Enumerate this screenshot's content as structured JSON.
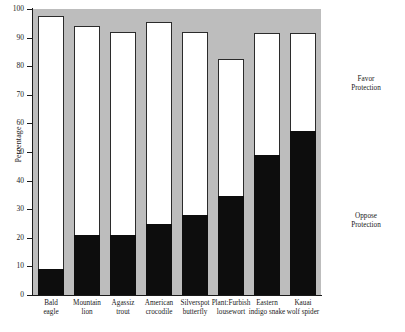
{
  "chart_data": {
    "type": "bar",
    "title": "",
    "subtitle": "",
    "xlabel": "",
    "ylabel": "Percentage",
    "ylim": [
      0,
      100
    ],
    "grid": false,
    "stacked": true,
    "legend_position": "right-inline",
    "categories": [
      "Bald eagle",
      "Mountain lion",
      "Agassiz trout",
      "American crocodile",
      "Silverspot butterfly",
      "Plant:Furbish lousewort",
      "Eastern indigo snake",
      "Kauai wolf spider"
    ],
    "category_lines": [
      [
        "Bald",
        "eagle"
      ],
      [
        "Mountain",
        "lion"
      ],
      [
        "Agassiz",
        "trout"
      ],
      [
        "American",
        "crocodile"
      ],
      [
        "Silverspot",
        "butterfly"
      ],
      [
        "Plant:Furbish",
        "lousewort"
      ],
      [
        "Eastern",
        "indigo snake"
      ],
      [
        "Kauai",
        "wolf spider"
      ]
    ],
    "series": [
      {
        "name": "Oppose Protection",
        "color": "#0d0d0d",
        "values": [
          9,
          21,
          21,
          25,
          28,
          34.5,
          49,
          57.5
        ]
      },
      {
        "name": "Favor Protection",
        "color": "#ffffff",
        "values": [
          88.5,
          73,
          71,
          70.5,
          64,
          48,
          42.5,
          34
        ]
      }
    ],
    "totals": [
      97.5,
      94,
      92,
      95.5,
      92,
      82.5,
      91.5,
      91.5
    ],
    "y_ticks": [
      0,
      10,
      20,
      30,
      40,
      50,
      60,
      70,
      80,
      90,
      100
    ],
    "y_tick_labels": [
      "0",
      "10",
      "20",
      "30",
      "40",
      "50",
      "60",
      "70",
      "80",
      "90",
      "100"
    ],
    "annotations": [
      {
        "id": "favor",
        "lines": [
          "Favor",
          "Protection"
        ]
      },
      {
        "id": "oppose",
        "lines": [
          "Oppose",
          "Protection"
        ]
      }
    ],
    "plot_background_color": "#bdbdbd",
    "axis_color": "#1a1a1a"
  }
}
